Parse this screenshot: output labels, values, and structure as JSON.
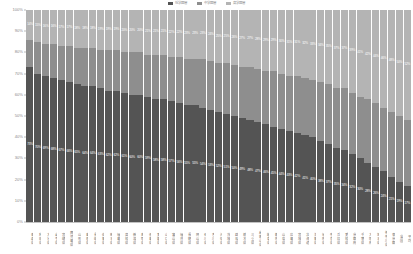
{
  "legend": {
    "items": [
      {
        "label": "低学歴層",
        "color": "#545454"
      },
      {
        "label": "中学歴層",
        "color": "#8e8e8e"
      },
      {
        "label": "高学歴層",
        "color": "#b4b4b4"
      }
    ]
  },
  "axes": {
    "y_ticks": [
      "100%",
      "90%",
      "80%",
      "70%",
      "60%",
      "50%",
      "40%",
      "30%",
      "20%",
      "10%",
      "0%"
    ],
    "y_min": 0,
    "y_max": 100
  },
  "colors": {
    "series_low": "#545454",
    "series_mid": "#8e8e8e",
    "series_high": "#b4b4b4",
    "axis_text": "#8a8a8a",
    "label_text": "#ffffff",
    "background": "#ffffff"
  },
  "chart_data": {
    "type": "bar",
    "stacked": true,
    "normalized_percent": true,
    "title": "",
    "xlabel": "",
    "ylabel": "",
    "ylim": [
      0,
      100
    ],
    "grid": false,
    "legend_position": "top",
    "categories": [
      "青森県",
      "秋田県",
      "大分県",
      "岩手県",
      "宮崎県",
      "鹿児島県",
      "山形県",
      "島根県",
      "長崎県",
      "佐賀県",
      "熊本県",
      "福島県",
      "高知県",
      "新潟県",
      "鳥取県",
      "徳島県",
      "愛媛県",
      "山口県",
      "富山県",
      "福井県",
      "長野県",
      "岡山県",
      "石川県",
      "香川県",
      "沖縄県",
      "茨城県",
      "群馬県",
      "栃木県",
      "三重県",
      "和歌山県",
      "岐阜県",
      "静岡県",
      "山梨県",
      "広島県",
      "宮城県",
      "北海道",
      "滋賀県",
      "福岡県",
      "奈良県",
      "兵庫県",
      "愛知県",
      "京都府",
      "千葉県",
      "大阪府",
      "埼玉県",
      "神奈川県",
      "東京都",
      "全国",
      "平均"
    ],
    "series": [
      {
        "name": "低学歴層",
        "color": "#545454",
        "values": [
          73,
          70,
          69,
          68,
          67,
          66,
          65,
          64,
          64,
          63,
          62,
          62,
          61,
          60,
          60,
          59,
          58,
          58,
          57,
          56,
          55,
          55,
          54,
          53,
          52,
          51,
          50,
          49,
          48,
          47,
          46,
          45,
          44,
          43,
          42,
          41,
          40,
          38,
          37,
          35,
          34,
          32,
          30,
          28,
          26,
          24,
          21,
          19,
          17
        ]
      },
      {
        "name": "中学歴層",
        "color": "#8e8e8e",
        "values": [
          13,
          15,
          15,
          16,
          16,
          17,
          17,
          18,
          18,
          18,
          19,
          19,
          19,
          20,
          20,
          20,
          21,
          21,
          21,
          22,
          22,
          22,
          23,
          23,
          23,
          24,
          24,
          24,
          25,
          25,
          25,
          26,
          26,
          26,
          27,
          27,
          27,
          28,
          28,
          28,
          29,
          29,
          29,
          30,
          30,
          30,
          31,
          31,
          31
        ]
      },
      {
        "name": "高学歴層",
        "color": "#b4b4b4",
        "values": [
          14,
          15,
          16,
          16,
          17,
          17,
          18,
          18,
          18,
          19,
          19,
          19,
          20,
          20,
          20,
          21,
          21,
          21,
          22,
          22,
          23,
          23,
          23,
          24,
          25,
          25,
          26,
          27,
          27,
          28,
          29,
          29,
          30,
          31,
          31,
          32,
          33,
          34,
          35,
          37,
          37,
          39,
          41,
          42,
          44,
          46,
          48,
          50,
          52
        ]
      }
    ],
    "data_labels": {
      "low_series_labels": [
        "73%",
        "70%",
        "69%",
        "68%",
        "67%",
        "66%",
        "65%",
        "64%",
        "64%",
        "63%",
        "62%",
        "62%",
        "61%",
        "60%",
        "60%",
        "59%",
        "58%",
        "58%",
        "57%",
        "56%",
        "55%",
        "55%",
        "54%",
        "53%",
        "52%",
        "51%",
        "50%",
        "49%",
        "48%",
        "47%",
        "46%",
        "45%",
        "44%",
        "43%",
        "42%",
        "41%",
        "40%",
        "38%",
        "37%",
        "35%",
        "34%",
        "32%",
        "30%",
        "28%",
        "26%",
        "24%",
        "21%",
        "19%",
        "17%"
      ],
      "high_series_labels": [
        "14%",
        "15%",
        "16%",
        "16%",
        "17%",
        "17%",
        "18%",
        "18%",
        "18%",
        "19%",
        "19%",
        "19%",
        "20%",
        "20%",
        "20%",
        "21%",
        "21%",
        "21%",
        "22%",
        "22%",
        "23%",
        "23%",
        "23%",
        "24%",
        "25%",
        "25%",
        "26%",
        "27%",
        "27%",
        "28%",
        "29%",
        "29%",
        "30%",
        "31%",
        "31%",
        "32%",
        "33%",
        "34%",
        "35%",
        "37%",
        "37%",
        "39%",
        "41%",
        "42%",
        "44%",
        "46%",
        "48%",
        "50%",
        "52%"
      ]
    }
  }
}
